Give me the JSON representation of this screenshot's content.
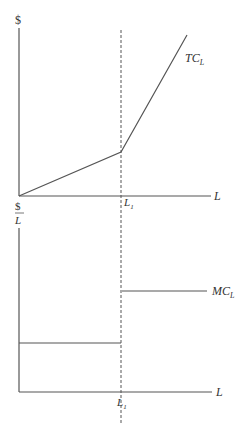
{
  "diagram": {
    "colors": {
      "line": "#555555",
      "text": "#333333",
      "background": "#ffffff"
    },
    "top_panel": {
      "y_axis_label": "$",
      "x_axis_label": "L",
      "origin_label": "$",
      "curve_label": "TC",
      "curve_label_sub": "L",
      "marker_label": "L",
      "marker_label_sub": "1",
      "curve_points": [
        [
          19,
          196
        ],
        [
          121,
          152
        ],
        [
          187,
          35
        ]
      ]
    },
    "bottom_panel": {
      "y_axis_label_num": "$",
      "y_axis_label_den": "L",
      "x_axis_label": "L",
      "curve_label": "MC",
      "curve_label_sub": "L",
      "marker_label": "L",
      "marker_label_sub": "1",
      "lower_segment_y": 343,
      "upper_segment_y": 291
    },
    "dashed_line": {
      "x": 121,
      "y_start": 30,
      "y_end": 423
    },
    "caption_partial": ""
  }
}
